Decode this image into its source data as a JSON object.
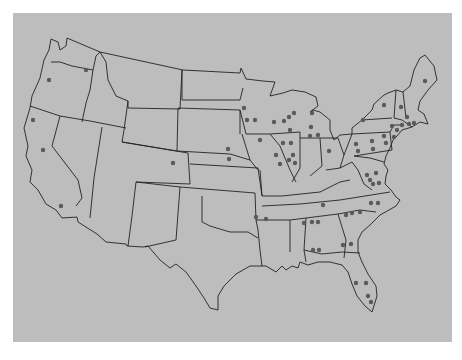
{
  "map": {
    "title": "",
    "region": "Contiguous United States",
    "background_color": "#ffffff",
    "panel_color": "#bdbdbd",
    "border_color": "#222222",
    "marker_color": "#5a5a5a",
    "marker_radius": 2.2,
    "markers": [
      {
        "state": "WA",
        "x": 86,
        "y": 70
      },
      {
        "state": "OR",
        "x": 49,
        "y": 80
      },
      {
        "state": "CA",
        "x": 33,
        "y": 120
      },
      {
        "state": "CA",
        "x": 43,
        "y": 150
      },
      {
        "state": "CA",
        "x": 61,
        "y": 206
      },
      {
        "state": "CO",
        "x": 173,
        "y": 163
      },
      {
        "state": "NE",
        "x": 228,
        "y": 149
      },
      {
        "state": "NE",
        "x": 229,
        "y": 159
      },
      {
        "state": "MN",
        "x": 244,
        "y": 108
      },
      {
        "state": "MN",
        "x": 247,
        "y": 120
      },
      {
        "state": "MN",
        "x": 255,
        "y": 120
      },
      {
        "state": "IA",
        "x": 260,
        "y": 140
      },
      {
        "state": "WI",
        "x": 274,
        "y": 122
      },
      {
        "state": "WI",
        "x": 284,
        "y": 121
      },
      {
        "state": "WI",
        "x": 290,
        "y": 130
      },
      {
        "state": "WI",
        "x": 289,
        "y": 117
      },
      {
        "state": "WI",
        "x": 294,
        "y": 113
      },
      {
        "state": "IL",
        "x": 283,
        "y": 143
      },
      {
        "state": "IL",
        "x": 291,
        "y": 143
      },
      {
        "state": "IL",
        "x": 276,
        "y": 155
      },
      {
        "state": "IL",
        "x": 293,
        "y": 155
      },
      {
        "state": "IL",
        "x": 289,
        "y": 160
      },
      {
        "state": "IL",
        "x": 280,
        "y": 164
      },
      {
        "state": "IL",
        "x": 295,
        "y": 163
      },
      {
        "state": "MI",
        "x": 312,
        "y": 113
      },
      {
        "state": "MI",
        "x": 311,
        "y": 127
      },
      {
        "state": "MI",
        "x": 310,
        "y": 136
      },
      {
        "state": "MI",
        "x": 318,
        "y": 135
      },
      {
        "state": "OH",
        "x": 329,
        "y": 151
      },
      {
        "state": "NY",
        "x": 384,
        "y": 105
      },
      {
        "state": "NY",
        "x": 363,
        "y": 120
      },
      {
        "state": "ME",
        "x": 425,
        "y": 81
      },
      {
        "state": "VT",
        "x": 401,
        "y": 107
      },
      {
        "state": "NH",
        "x": 407,
        "y": 117
      },
      {
        "state": "MA",
        "x": 402,
        "y": 125
      },
      {
        "state": "MA",
        "x": 409,
        "y": 124
      },
      {
        "state": "MA",
        "x": 414,
        "y": 123
      },
      {
        "state": "CT",
        "x": 392,
        "y": 126
      },
      {
        "state": "CT",
        "x": 397,
        "y": 130
      },
      {
        "state": "PA",
        "x": 356,
        "y": 144
      },
      {
        "state": "PA",
        "x": 372,
        "y": 141
      },
      {
        "state": "PA",
        "x": 384,
        "y": 136
      },
      {
        "state": "PA",
        "x": 386,
        "y": 143
      },
      {
        "state": "PA",
        "x": 358,
        "y": 151
      },
      {
        "state": "PA",
        "x": 373,
        "y": 149
      },
      {
        "state": "NJ",
        "x": 394,
        "y": 137
      },
      {
        "state": "VA",
        "x": 367,
        "y": 175
      },
      {
        "state": "VA",
        "x": 376,
        "y": 173
      },
      {
        "state": "VA",
        "x": 373,
        "y": 184
      },
      {
        "state": "VA",
        "x": 379,
        "y": 183
      },
      {
        "state": "NC",
        "x": 371,
        "y": 203
      },
      {
        "state": "NC",
        "x": 378,
        "y": 203
      },
      {
        "state": "NC",
        "x": 370,
        "y": 180
      },
      {
        "state": "TN",
        "x": 323,
        "y": 205
      },
      {
        "state": "AR",
        "x": 256,
        "y": 217
      },
      {
        "state": "AR",
        "x": 266,
        "y": 219
      },
      {
        "state": "SC",
        "x": 346,
        "y": 215
      },
      {
        "state": "SC",
        "x": 352,
        "y": 213
      },
      {
        "state": "NC",
        "x": 360,
        "y": 212
      },
      {
        "state": "AL",
        "x": 304,
        "y": 223
      },
      {
        "state": "AL",
        "x": 312,
        "y": 222
      },
      {
        "state": "AL",
        "x": 318,
        "y": 222
      },
      {
        "state": "AL",
        "x": 313,
        "y": 250
      },
      {
        "state": "AL",
        "x": 319,
        "y": 250
      },
      {
        "state": "GA",
        "x": 343,
        "y": 245
      },
      {
        "state": "GA",
        "x": 351,
        "y": 244
      },
      {
        "state": "FL",
        "x": 356,
        "y": 283
      },
      {
        "state": "FL",
        "x": 366,
        "y": 283
      },
      {
        "state": "FL",
        "x": 368,
        "y": 296
      },
      {
        "state": "FL",
        "x": 371,
        "y": 302
      }
    ]
  }
}
